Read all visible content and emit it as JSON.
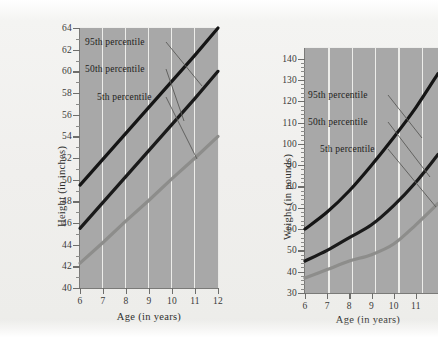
{
  "figure": {
    "background_color": "#f0efed",
    "panel_color": "#a8a8a8",
    "gridline_color": "#ededea"
  },
  "chart_data": [
    {
      "type": "line",
      "id": "height-chart",
      "title": "",
      "xlabel": "Age (in years)",
      "ylabel": "Height (in inches)",
      "x": [
        6,
        7,
        8,
        9,
        10,
        11,
        12
      ],
      "xlim": [
        6,
        12
      ],
      "ylim": [
        40,
        64
      ],
      "xticks": [
        "6",
        "7",
        "8",
        "9",
        "10",
        "11",
        "12"
      ],
      "yticks": [
        "40",
        "42",
        "44",
        "46",
        "48",
        "50",
        "52",
        "54",
        "56",
        "58",
        "60",
        "62",
        "64"
      ],
      "ytick_step": 2,
      "yminor_step": 1,
      "grid": "vertical",
      "legend_position": "inside-annotations",
      "series": [
        {
          "name": "95th percentile",
          "color": "#151515",
          "values": [
            49.5,
            51.9,
            54.3,
            56.7,
            59.1,
            61.5,
            64.0
          ]
        },
        {
          "name": "50th percentile",
          "color": "#1a1a1a",
          "values": [
            45.5,
            47.9,
            50.3,
            52.7,
            55.1,
            57.5,
            60.0
          ]
        },
        {
          "name": "5th percentile",
          "color": "#8d8d8b",
          "values": [
            42.3,
            44.2,
            46.2,
            48.1,
            50.1,
            52.0,
            54.0
          ]
        }
      ],
      "annotations": [
        {
          "text": "95th percentile",
          "series": "95th percentile"
        },
        {
          "text": "50th percentile",
          "series": "50th percentile"
        },
        {
          "text": "5th percentile",
          "series": "5th percentile"
        }
      ]
    },
    {
      "type": "line",
      "id": "weight-chart",
      "title": "",
      "xlabel": "Age (in years)",
      "ylabel": "Weight (in pounds)",
      "x": [
        6,
        7,
        8,
        9,
        10,
        11,
        12
      ],
      "xlim": [
        6,
        12
      ],
      "ylim": [
        30,
        145
      ],
      "xticks": [
        "6",
        "7",
        "8",
        "9",
        "10",
        "11",
        "12"
      ],
      "xticks_visible": [
        "6",
        "7",
        "8",
        "9",
        "10",
        "11"
      ],
      "yticks": [
        "30",
        "40",
        "50",
        "60",
        "70",
        "80",
        "90",
        "100",
        "110",
        "120",
        "130",
        "140"
      ],
      "ytick_step": 10,
      "yminor_step": 2,
      "grid": "vertical",
      "cropped_right_edge": true,
      "legend_position": "inside-annotations",
      "series": [
        {
          "name": "95th percentile",
          "color": "#151515",
          "values": [
            60,
            68,
            78,
            90,
            103,
            117,
            133
          ]
        },
        {
          "name": "50th percentile",
          "color": "#1a1a1a",
          "values": [
            45,
            50,
            56,
            62,
            71,
            82,
            95
          ]
        },
        {
          "name": "5th percentile",
          "color": "#8d8d8b",
          "values": [
            37,
            41,
            45,
            48,
            53,
            62,
            72
          ]
        }
      ],
      "annotations": [
        {
          "text": "95th percentile",
          "series": "95th percentile"
        },
        {
          "text": "50th percentile",
          "series": "50th percentile"
        },
        {
          "text": "5th percentile",
          "series": "5th percentile"
        }
      ]
    }
  ]
}
